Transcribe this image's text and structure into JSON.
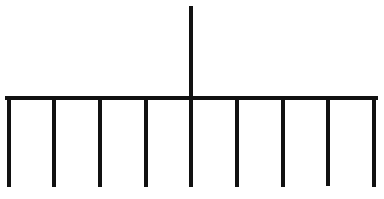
{
  "diagram": {
    "type": "comb-tree",
    "stroke_color": "#111111",
    "background_color": "#ffffff",
    "stroke_width": 4,
    "stem": {
      "x": 191,
      "y_top": 8,
      "y_bottom": 98
    },
    "bar": {
      "x_start": 7,
      "x_end": 376,
      "y": 98
    },
    "legs": [
      {
        "x": 9,
        "y_top": 98,
        "y_bottom": 185
      },
      {
        "x": 54,
        "y_top": 98,
        "y_bottom": 185
      },
      {
        "x": 100,
        "y_top": 98,
        "y_bottom": 185
      },
      {
        "x": 146,
        "y_top": 98,
        "y_bottom": 185
      },
      {
        "x": 191,
        "y_top": 98,
        "y_bottom": 185
      },
      {
        "x": 237,
        "y_top": 98,
        "y_bottom": 185
      },
      {
        "x": 283,
        "y_top": 98,
        "y_bottom": 185
      },
      {
        "x": 328,
        "y_top": 98,
        "y_bottom": 184
      },
      {
        "x": 374,
        "y_top": 98,
        "y_bottom": 185
      }
    ],
    "leg_count": 9
  }
}
